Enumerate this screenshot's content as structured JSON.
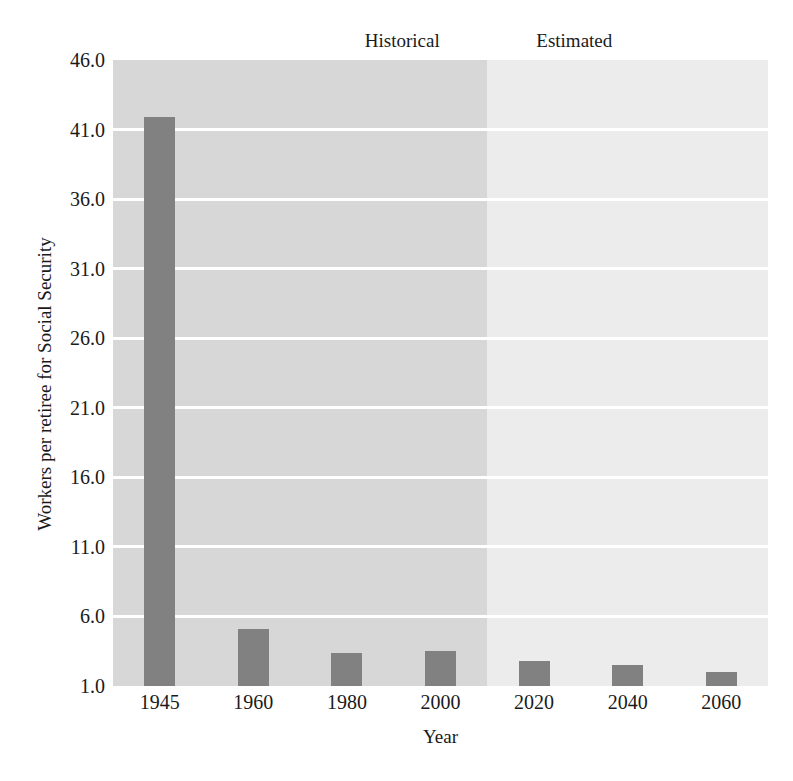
{
  "chart_data": {
    "type": "bar",
    "title": "",
    "subtitle": "",
    "xlabel": "Year",
    "ylabel": "Workers per retiree for Social Security",
    "categories": [
      "1945",
      "1960",
      "1980",
      "2000",
      "2020",
      "2040",
      "2060"
    ],
    "values": [
      41.9,
      5.1,
      3.4,
      3.5,
      2.8,
      2.5,
      2.0
    ],
    "series": [
      {
        "name": "Workers per retiree",
        "values": [
          41.9,
          5.1,
          3.4,
          3.5,
          2.8,
          2.5,
          2.0
        ],
        "color": "#818181"
      }
    ],
    "ylim": [
      1.0,
      46.0
    ],
    "ytick_values": [
      46.0,
      41.0,
      36.0,
      31.0,
      26.0,
      21.0,
      16.0,
      11.0,
      6.0,
      1.0
    ],
    "ytick_labels": [
      "46.0",
      "41.0",
      "36.0",
      "31.0",
      "26.0",
      "21.0",
      "16.0",
      "11.0",
      "6.0",
      "1.0"
    ],
    "grid": true,
    "grid_color": "#ffffff",
    "legend": "none",
    "annotations": [
      {
        "name": "historical",
        "label": "Historical",
        "span_categories": [
          "1945",
          "2000"
        ],
        "band_color": "#d7d7d7"
      },
      {
        "name": "estimated",
        "label": "Estimated",
        "span_categories": [
          "2020",
          "2060"
        ],
        "band_color": "#ececec"
      }
    ],
    "background_color": "#ffffff"
  }
}
